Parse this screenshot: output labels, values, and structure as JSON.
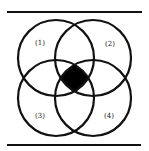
{
  "diagram": {
    "type": "four-set venn diagram",
    "sets": [
      {
        "id": 1,
        "label": "(1)",
        "position": "top-left"
      },
      {
        "id": 2,
        "label": "(2)",
        "position": "top-right"
      },
      {
        "id": 3,
        "label": "(3)",
        "position": "bottom-left"
      },
      {
        "id": 4,
        "label": "(4)",
        "position": "bottom-right"
      }
    ],
    "highlighted_region": "intersection of all four sets",
    "colors": {
      "stroke": "#111111",
      "highlight": "#000000",
      "background": "#ffffff"
    }
  }
}
